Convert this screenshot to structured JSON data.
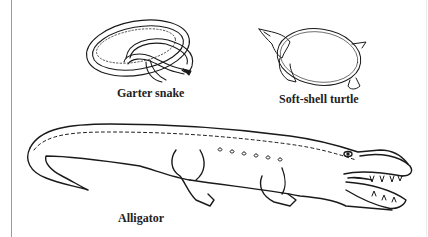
{
  "figure": {
    "labels": {
      "snake": "Garter snake",
      "turtle": "Soft-shell turtle",
      "alligator": "Alligator"
    },
    "colors": {
      "ink": "#1a1a1a",
      "background": "#ffffff",
      "border": "#9a9a9a"
    }
  }
}
